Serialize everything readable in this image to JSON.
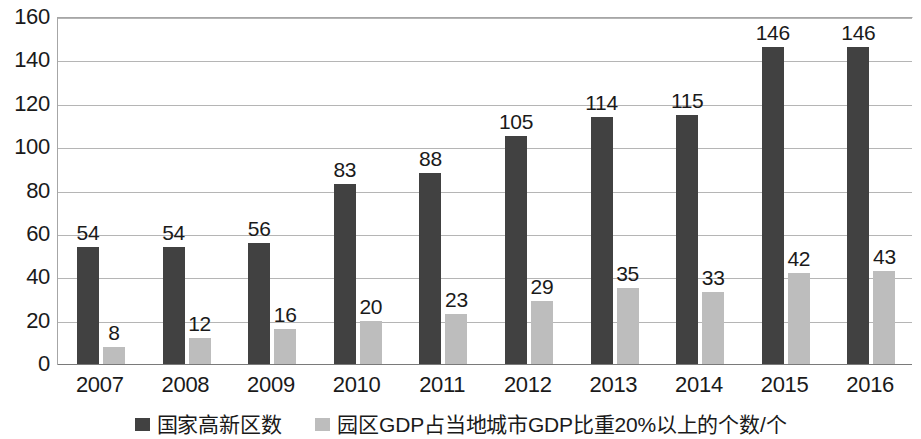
{
  "chart_data": {
    "type": "bar",
    "title": "",
    "xlabel": "",
    "ylabel": "",
    "categories": [
      "2007",
      "2008",
      "2009",
      "2010",
      "2011",
      "2012",
      "2013",
      "2014",
      "2015",
      "2016"
    ],
    "series": [
      {
        "name": "国家高新区数",
        "color": "#414141",
        "values": [
          54,
          54,
          56,
          83,
          88,
          105,
          114,
          115,
          146,
          146
        ]
      },
      {
        "name": "园区GDP占当地城市GDP比重20%以上的个数/个",
        "color": "#bdbdbd",
        "values": [
          8,
          12,
          16,
          20,
          23,
          29,
          35,
          33,
          42,
          43
        ]
      }
    ],
    "ylim": [
      0,
      160
    ],
    "y_ticks": [
      "0",
      "20",
      "40",
      "60",
      "80",
      "100",
      "120",
      "140",
      "160"
    ],
    "grid": true,
    "legend_position": "bottom",
    "data_labels": true
  },
  "legend": {
    "items": [
      {
        "label": "国家高新区数",
        "color": "#414141"
      },
      {
        "label": "园区GDP占当地城市GDP比重20%以上的个数/个",
        "color": "#bdbdbd"
      }
    ]
  }
}
